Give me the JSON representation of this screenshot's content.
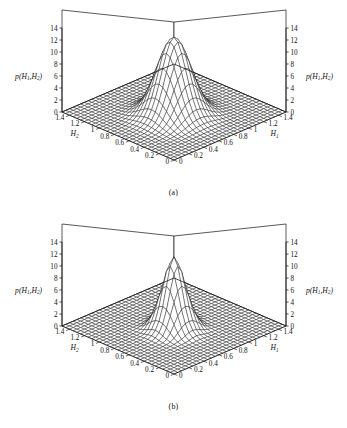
{
  "figure": {
    "background": "#ffffff",
    "line_color": "#111111",
    "panels": [
      {
        "id": "a",
        "caption": "(a)",
        "peak_style": "broad-smooth"
      },
      {
        "id": "b",
        "caption": "(b)",
        "peak_style": "narrow-spiky"
      }
    ]
  },
  "labels": {
    "z_axis_label": "p(H₁,H₂)",
    "z_axis_label_parts": {
      "p": "p",
      "open": "(",
      "h": "H",
      "sub1": "1",
      "comma": ",",
      "sub2": "2",
      "close": ")"
    },
    "x_axis_label": "H₁",
    "y_axis_label": "H₂",
    "x_axis_base": "H",
    "x_axis_sub": "1",
    "y_axis_base": "H",
    "y_axis_sub": "2",
    "origin_left": "0",
    "origin_right": "0"
  },
  "chart_data": [
    {
      "type": "surface",
      "id": "a",
      "title": "(a)",
      "xlabel": "H₁",
      "ylabel": "H₂",
      "zlabel": "p(H₁,H₂)",
      "xlim": [
        0,
        1.5
      ],
      "ylim": [
        0,
        1.5
      ],
      "zlim": [
        0,
        14
      ],
      "z_ticks": [
        0,
        2,
        4,
        6,
        8,
        10,
        12,
        14
      ],
      "z_ticks_left": [
        "0",
        "2",
        "4",
        "6",
        "8",
        "10",
        "12",
        "14"
      ],
      "z_ticks_right": [
        "0",
        "2",
        "4",
        "6",
        "8",
        "10",
        "12",
        "14"
      ],
      "x_ticks": [
        0,
        0.2,
        0.4,
        0.6,
        0.8,
        1.0,
        1.2,
        1.4
      ],
      "x_tick_labels": [
        "0",
        "0.2",
        "0.4",
        "0.6",
        "0.8",
        "1",
        "1.2",
        "1.4"
      ],
      "y_ticks": [
        0,
        0.2,
        0.4,
        0.6,
        0.8,
        1.0,
        1.2,
        1.4
      ],
      "y_tick_labels": [
        "0",
        "0.2",
        "0.4",
        "0.6",
        "0.8",
        "1",
        "1.2",
        "1.4"
      ],
      "grid": true,
      "legend": "none",
      "mesh": {
        "nx": 30,
        "ny": 30
      },
      "surface": {
        "function": "gaussian",
        "peak_value": 13.0,
        "center_x": 0.7,
        "center_y": 0.7,
        "sigma_x": 0.165,
        "sigma_y": 0.165,
        "baseline": 0.0
      }
    },
    {
      "type": "surface",
      "id": "b",
      "title": "(b)",
      "xlabel": "H₁",
      "ylabel": "H₂",
      "zlabel": "p(H₁,H₂)",
      "xlim": [
        0,
        1.5
      ],
      "ylim": [
        0,
        1.5
      ],
      "zlim": [
        0,
        14
      ],
      "z_ticks": [
        0,
        2,
        4,
        6,
        8,
        10,
        12,
        14
      ],
      "z_ticks_left": [
        "0",
        "2",
        "4",
        "6",
        "8",
        "10",
        "12",
        "14"
      ],
      "z_ticks_right": [
        "0",
        "2",
        "4",
        "6",
        "8",
        "10",
        "12",
        "14"
      ],
      "x_ticks": [
        0,
        0.2,
        0.4,
        0.6,
        0.8,
        1.0,
        1.2,
        1.4
      ],
      "x_tick_labels": [
        "0",
        "0.2",
        "0.4",
        "0.6",
        "0.8",
        "1",
        "1.2",
        "1.4"
      ],
      "y_ticks": [
        0,
        0.2,
        0.4,
        0.6,
        0.8,
        1.0,
        1.2,
        1.4
      ],
      "y_tick_labels": [
        "0",
        "0.2",
        "0.4",
        "0.6",
        "0.8",
        "1",
        "1.2",
        "1.4"
      ],
      "grid": true,
      "legend": "none",
      "mesh": {
        "nx": 30,
        "ny": 30
      },
      "surface": {
        "function": "gaussian",
        "peak_value": 11.5,
        "center_x": 0.7,
        "center_y": 0.7,
        "sigma_x": 0.115,
        "sigma_y": 0.115,
        "baseline": 0.0,
        "ripple_amplitude": 0.55
      }
    }
  ]
}
